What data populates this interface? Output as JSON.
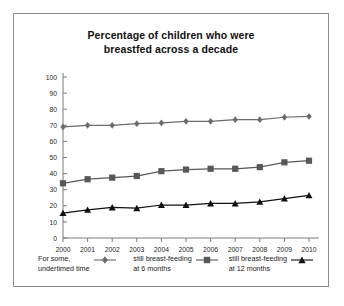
{
  "figure": {
    "border_color": "#8d8d8d",
    "background": "#ffffff"
  },
  "chart_data": {
    "type": "line",
    "title": "Percentage of children who were breastfed across a decade",
    "title_line1": "Percentage of children who were",
    "title_line2": "breastfed across a decade",
    "xlabel": "",
    "ylabel": "",
    "x": [
      2000,
      2001,
      2002,
      2003,
      2004,
      2005,
      2006,
      2007,
      2008,
      2009,
      2010
    ],
    "categories": [
      "2000",
      "2001",
      "2002",
      "2003",
      "2004",
      "2005",
      "2006",
      "2007",
      "2008",
      "2009",
      "2010"
    ],
    "ylim": [
      0,
      100
    ],
    "yticks": [
      0,
      10,
      20,
      30,
      40,
      50,
      60,
      70,
      80,
      90,
      100
    ],
    "ytick_labels": [
      "0",
      "10",
      "20",
      "30",
      "40",
      "50",
      "60",
      "70",
      "80",
      "90",
      "100"
    ],
    "grid": false,
    "legend_position": "below-axes",
    "series": [
      {
        "name": "For some, undertimed time",
        "name_line1": "For some,",
        "name_line2": "undertimed time",
        "marker": "diamond",
        "color": "#6b6b6b",
        "values": [
          69,
          70,
          70,
          71,
          71.5,
          72.5,
          72.5,
          73.5,
          73.5,
          75,
          75.5
        ]
      },
      {
        "name": "still breast-feeding at 6 months",
        "name_line1": "still breast-feeding",
        "name_line2": "at 6 months",
        "marker": "square",
        "color": "#585858",
        "values": [
          34,
          36.5,
          37.5,
          38.5,
          41.5,
          42.5,
          43,
          43,
          44,
          47,
          48
        ]
      },
      {
        "name": "still breast-feeding at 12 months",
        "name_line1": "still breast-feeding",
        "name_line2": "at 12 months",
        "marker": "triangle",
        "color": "#111111",
        "values": [
          15.5,
          17.5,
          19,
          18.5,
          20.5,
          20.5,
          21.5,
          21.5,
          22.5,
          24.5,
          26.5
        ]
      }
    ]
  },
  "watermark": {
    "text": ""
  }
}
